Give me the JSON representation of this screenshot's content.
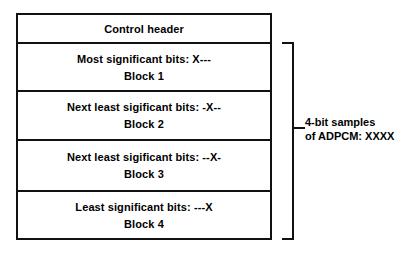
{
  "diagram": {
    "line_color": "#111111",
    "background_color": "#ffffff",
    "packet": {
      "header": {
        "label": "Control header"
      },
      "blocks": [
        {
          "description": "Most significant bits: X---",
          "name": "Block 1"
        },
        {
          "description": "Next least sigificant bits: -X--",
          "name": "Block 2"
        },
        {
          "description": "Next least sigificant bits: --X-",
          "name": "Block 3"
        },
        {
          "description": "Least significant bits: ---X",
          "name": "Block 4"
        }
      ]
    },
    "annotation": {
      "line_1": "4-bit samples",
      "line_2": "of ADPCM: XXXX"
    }
  }
}
